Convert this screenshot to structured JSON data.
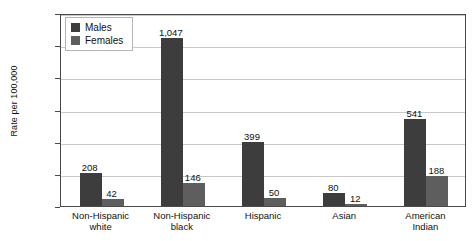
{
  "chart_data": {
    "type": "bar",
    "title": "",
    "xlabel": "",
    "ylabel": "Rate per 100,000",
    "ylim": [
      0,
      1200
    ],
    "yticks": [
      "0",
      "200",
      "400",
      "600",
      "800",
      "1,000",
      "1,200"
    ],
    "grid": true,
    "legend_position": "top-left",
    "categories": [
      "Non-Hispanic\nwhite",
      "Non-Hispanic\nblack",
      "Hispanic",
      "Asian",
      "American\nIndian"
    ],
    "category_lines": [
      [
        "Non-Hispanic",
        "white"
      ],
      [
        "Non-Hispanic",
        "black"
      ],
      [
        "Hispanic",
        ""
      ],
      [
        "Asian",
        ""
      ],
      [
        "American",
        "Indian"
      ]
    ],
    "series": [
      {
        "name": "Males",
        "color": "#3d3d3d",
        "values": [
          208,
          1047,
          399,
          80,
          541
        ],
        "labels": [
          "208",
          "1,047",
          "399",
          "80",
          "541"
        ]
      },
      {
        "name": "Females",
        "color": "#5e5e5e",
        "values": [
          42,
          146,
          50,
          12,
          188
        ],
        "labels": [
          "42",
          "146",
          "50",
          "12",
          "188"
        ]
      }
    ]
  },
  "legend": {
    "items": [
      {
        "label": "Males"
      },
      {
        "label": "Females"
      }
    ]
  }
}
